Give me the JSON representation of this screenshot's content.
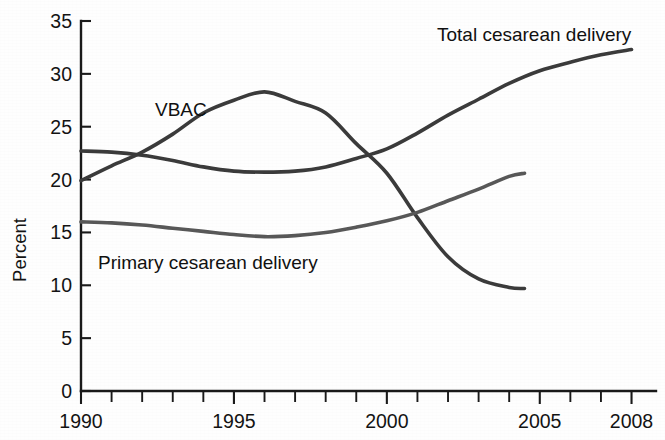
{
  "chart_data": {
    "type": "line",
    "title": "",
    "subtitle": "",
    "xlabel": "",
    "ylabel": "Percent",
    "xlim": [
      1990,
      2008.8
    ],
    "ylim": [
      0,
      35
    ],
    "grid": false,
    "legend_position": "inline-annotations",
    "y_ticks": [
      0,
      5,
      10,
      15,
      20,
      25,
      30,
      35
    ],
    "y_tick_labels": [
      "0",
      "5",
      "10",
      "15",
      "20",
      "25",
      "30",
      "35"
    ],
    "x_ticks": [
      1990,
      1991,
      1992,
      1993,
      1994,
      1995,
      1996,
      1997,
      1998,
      1999,
      2000,
      2001,
      2002,
      2003,
      2004,
      2005,
      2006,
      2007,
      2008
    ],
    "x_tick_labels_shown": [
      "1990",
      "1995",
      "2000",
      "2005",
      "2008"
    ],
    "x_tick_label_values": [
      1990,
      1995,
      2000,
      2005,
      2008
    ],
    "series": [
      {
        "name": "Total cesarean delivery",
        "color": "#3b3b3b",
        "x": [
          1990,
          1991,
          1992,
          1993,
          1994,
          1995,
          1996,
          1997,
          1998,
          1999,
          2000,
          2001,
          2002,
          2003,
          2004,
          2005,
          2006,
          2007,
          2008
        ],
        "values": [
          22.7,
          22.6,
          22.3,
          21.8,
          21.2,
          20.8,
          20.7,
          20.8,
          21.2,
          22.0,
          22.9,
          24.4,
          26.1,
          27.6,
          29.1,
          30.3,
          31.1,
          31.8,
          32.3
        ]
      },
      {
        "name": "VBAC",
        "color": "#3b3b3b",
        "x": [
          1990,
          1991,
          1992,
          1993,
          1994,
          1995,
          1996,
          1997,
          1998,
          1999,
          2000,
          2001,
          2002,
          2003,
          2004,
          2004.5
        ],
        "values": [
          19.9,
          21.3,
          22.6,
          24.3,
          26.3,
          27.5,
          28.3,
          27.4,
          26.3,
          23.4,
          20.6,
          16.4,
          12.7,
          10.6,
          9.8,
          9.7
        ]
      },
      {
        "name": "Primary cesarean delivery",
        "color": "#585858",
        "x": [
          1990,
          1991,
          1992,
          1993,
          1994,
          1995,
          1996,
          1997,
          1998,
          1999,
          2000,
          2001,
          2002,
          2003,
          2004,
          2004.5
        ],
        "values": [
          16.0,
          15.9,
          15.7,
          15.4,
          15.1,
          14.8,
          14.6,
          14.7,
          15.0,
          15.5,
          16.1,
          16.9,
          18.0,
          19.1,
          20.3,
          20.6
        ]
      }
    ],
    "annotations": [
      {
        "text": "Total cesarean delivery",
        "x_px": 437,
        "y_px": 41,
        "for_series": "Total cesarean delivery"
      },
      {
        "text": "VBAC",
        "x_px": 155,
        "y_px": 116,
        "for_series": "VBAC"
      },
      {
        "text": "Primary cesarean delivery",
        "x_px": 98,
        "y_px": 269,
        "for_series": "Primary cesarean delivery"
      }
    ]
  },
  "axes": {
    "y_axis_title": "Percent"
  }
}
